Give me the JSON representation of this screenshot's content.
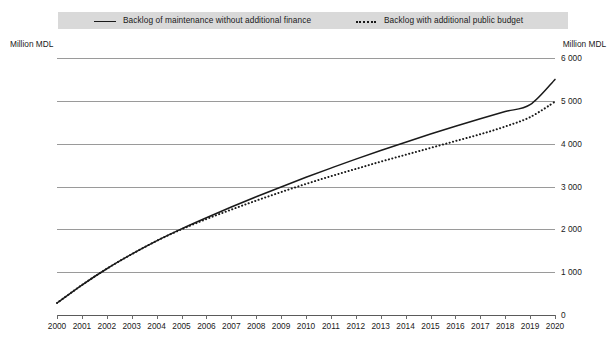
{
  "legend": {
    "entries": [
      {
        "label": "Backlog of maintenance without additional finance",
        "style": "solid",
        "color": "#1a1a1a"
      },
      {
        "label": "Backlog with additional public budget",
        "style": "dotted",
        "color": "#1a1a1a"
      }
    ]
  },
  "axes": {
    "left_caption": "Million MDL",
    "right_caption": "Million MDL"
  },
  "chart_data": {
    "type": "line",
    "title": "",
    "xlabel": "",
    "ylabel": "Million MDL",
    "ylim": [
      0,
      6000
    ],
    "ytick_labels": [
      "0",
      "1 000",
      "2 000",
      "3 000",
      "4 000",
      "5 000",
      "6 000"
    ],
    "ytick_values": [
      0,
      1000,
      2000,
      3000,
      4000,
      5000,
      6000
    ],
    "grid": true,
    "legend_position": "top",
    "x": [
      2000,
      2001,
      2002,
      2003,
      2004,
      2005,
      2006,
      2007,
      2008,
      2009,
      2010,
      2011,
      2012,
      2013,
      2014,
      2015,
      2016,
      2017,
      2018,
      2019,
      2020
    ],
    "xtick_labels": [
      "2000",
      "2001",
      "2002",
      "2003",
      "2004",
      "2005",
      "2006",
      "2007",
      "2008",
      "2009",
      "2010",
      "2011",
      "2012",
      "2013",
      "2014",
      "2015",
      "2016",
      "2017",
      "2018",
      "2019",
      "2020"
    ],
    "series": [
      {
        "name": "Backlog of maintenance without additional finance",
        "style": "solid",
        "color": "#1a1a1a",
        "values": [
          280,
          700,
          1080,
          1420,
          1730,
          2010,
          2270,
          2520,
          2760,
          2990,
          3215,
          3430,
          3640,
          3840,
          4035,
          4225,
          4405,
          4580,
          4750,
          4910,
          5500
        ]
      },
      {
        "name": "Backlog with additional public budget",
        "style": "dotted",
        "color": "#1a1a1a",
        "values": [
          280,
          700,
          1080,
          1420,
          1730,
          2000,
          2240,
          2460,
          2670,
          2870,
          3060,
          3240,
          3410,
          3580,
          3740,
          3900,
          4060,
          4220,
          4400,
          4620,
          4980
        ]
      }
    ]
  }
}
